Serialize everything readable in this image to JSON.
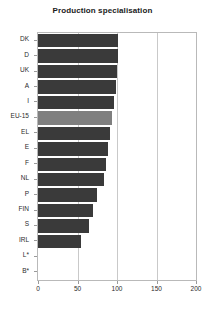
{
  "chart_data": {
    "type": "bar",
    "orientation": "horizontal",
    "title": "Production specialisation",
    "xlabel": "",
    "ylabel": "",
    "xlim": [
      0,
      200
    ],
    "xticks": [
      0,
      50,
      100,
      150,
      200
    ],
    "grid": true,
    "gridlines_at": [
      50,
      100,
      150
    ],
    "highlight_category": "EU-15",
    "colors": {
      "bar": "#3a3a3a",
      "highlight_bar": "#7f7f7f",
      "frame": "#b9b9b9",
      "grid": "#c9c9c9",
      "text": "#2b2b2b",
      "title": "#1a1a1a",
      "background": "#ffffff"
    },
    "categories": [
      "DK",
      "D",
      "UK",
      "A",
      "I",
      "EU-15",
      "EL",
      "E",
      "F",
      "NL",
      "P",
      "FIN",
      "S",
      "IRL",
      "L*",
      "B*"
    ],
    "values": [
      101,
      101,
      100,
      99,
      96,
      94,
      91,
      89,
      86,
      84,
      75,
      70,
      64,
      54,
      null,
      null
    ],
    "missing_note": "L* and B* have no data"
  }
}
